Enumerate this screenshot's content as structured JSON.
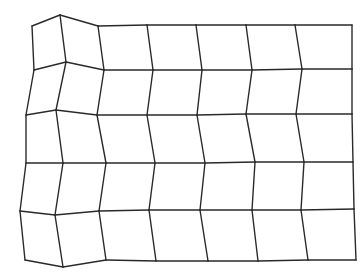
{
  "diagram": {
    "type": "deformed-quad-mesh",
    "columns": 7,
    "rows": 5,
    "stroke_color": "#2a2a2a",
    "background": "#ffffff",
    "nodes": [
      [
        [
          32,
          26
        ],
        [
          60,
          15
        ],
        [
          98,
          26
        ],
        [
          147,
          25
        ],
        [
          196,
          25
        ],
        [
          246,
          25
        ],
        [
          295,
          25
        ],
        [
          352,
          25
        ]
      ],
      [
        [
          34,
          70
        ],
        [
          66,
          62
        ],
        [
          104,
          70
        ],
        [
          153,
          70
        ],
        [
          202,
          70
        ],
        [
          252,
          70
        ],
        [
          302,
          69
        ],
        [
          352,
          69
        ]
      ],
      [
        [
          26,
          115
        ],
        [
          56,
          110
        ],
        [
          97,
          115
        ],
        [
          147,
          115
        ],
        [
          197,
          115
        ],
        [
          246,
          114
        ],
        [
          296,
          114
        ],
        [
          352,
          114
        ]
      ],
      [
        [
          26,
          163
        ],
        [
          63,
          163
        ],
        [
          106,
          163
        ],
        [
          155,
          163
        ],
        [
          205,
          163
        ],
        [
          255,
          162
        ],
        [
          304,
          162
        ],
        [
          353,
          162
        ]
      ],
      [
        [
          20,
          211
        ],
        [
          55,
          215
        ],
        [
          99,
          211
        ],
        [
          149,
          210
        ],
        [
          200,
          210
        ],
        [
          252,
          210
        ],
        [
          301,
          210
        ],
        [
          354,
          209
        ]
      ],
      [
        [
          25,
          260
        ],
        [
          63,
          267
        ],
        [
          106,
          260
        ],
        [
          156,
          261
        ],
        [
          208,
          261
        ],
        [
          258,
          261
        ],
        [
          308,
          260
        ],
        [
          356,
          260
        ]
      ]
    ]
  }
}
